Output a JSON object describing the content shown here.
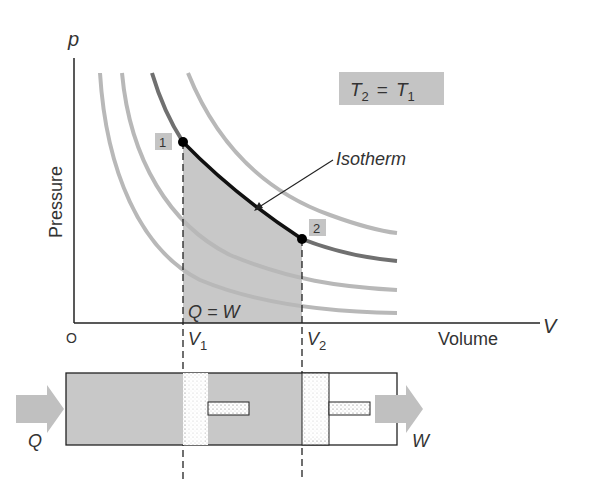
{
  "diagram": {
    "axes": {
      "y_symbol": "p",
      "y_label": "Pressure",
      "x_symbol": "V",
      "x_label": "Volume",
      "origin": "O"
    },
    "condition_box": {
      "t2": "T",
      "t2_sub": "2",
      "eq": "=",
      "t1": "T",
      "t1_sub": "1"
    },
    "isotherm_label": "Isotherm",
    "points": [
      {
        "label": "1"
      },
      {
        "label": "2"
      }
    ],
    "volume_marks": [
      {
        "symbol": "V",
        "sub": "1"
      },
      {
        "symbol": "V",
        "sub": "2"
      }
    ],
    "area_label": "Q = W",
    "piston": {
      "heat_in_label": "Q",
      "work_out_label": "W"
    },
    "colors": {
      "shade": "#c8c8c8",
      "curve_light": "#b4b4b4",
      "curve_dark": "#707070",
      "isotherm_bold": "#111111",
      "label_box": "#c4c4c4",
      "arrow": "#c0c0c0"
    }
  }
}
